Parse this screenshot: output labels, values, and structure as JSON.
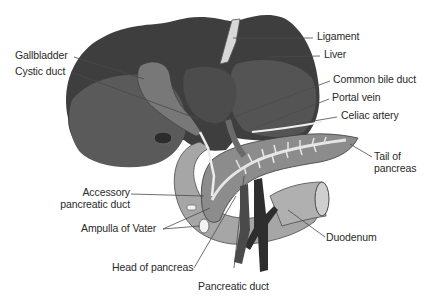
{
  "diagram": {
    "colors": {
      "background": "#ffffff",
      "liver_dark": "#3e3e3e",
      "liver_mid": "#5a5a5a",
      "gallbladder": "#7a7a7a",
      "pancreas": "#8c8c8c",
      "duodenum": "#a6a6a6",
      "duct": "#e8e8e8",
      "vessel_dark": "#2e2e2e",
      "text": "#2a2a2a",
      "leader_line": "#4a4a4a"
    },
    "labels": {
      "ligament": "Ligament",
      "liver": "Liver",
      "gallbladder": "Gallbladder",
      "cystic_duct": "Cystic duct",
      "common_bile_duct": "Common bile duct",
      "portal_vein": "Portal vein",
      "celiac_artery": "Celiac artery",
      "tail_of_pancreas_line1": "Tail of",
      "tail_of_pancreas_line2": "pancreas",
      "accessory_duct_line1": "Accessory",
      "accessory_duct_line2": "pancreatic duct",
      "ampulla_of_vater": "Ampulla of Vater",
      "duodenum": "Duodenum",
      "head_of_pancreas": "Head of pancreas",
      "pancreatic_duct": "Pancreatic duct"
    }
  }
}
